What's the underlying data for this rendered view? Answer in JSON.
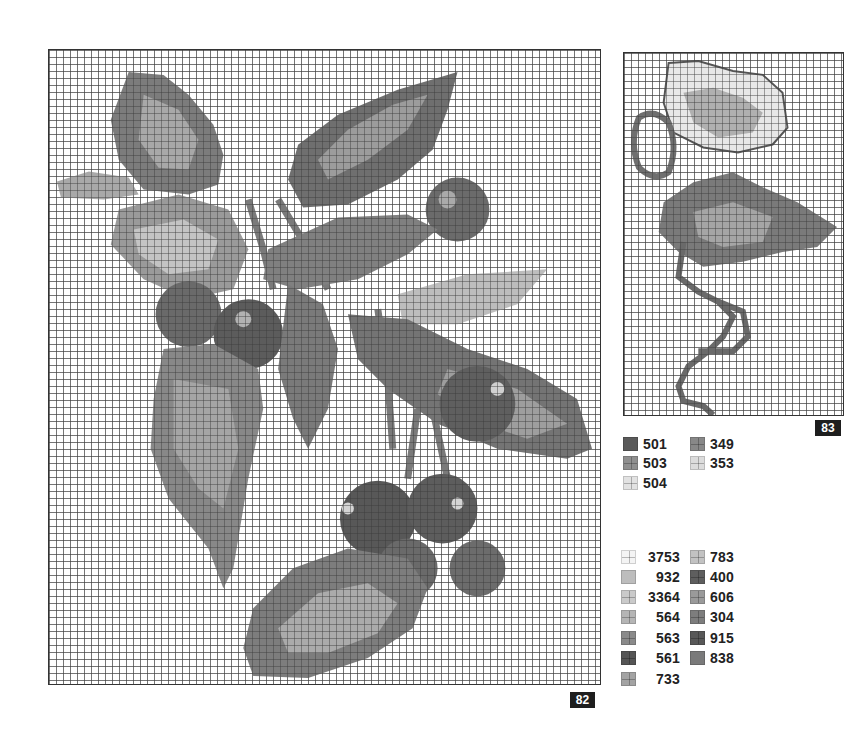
{
  "charts": [
    {
      "id": "main",
      "page_number": "82",
      "description": "Cross-stitch chart: cherry branch with leaves and clusters of cherries",
      "grid_cell_px": 7
    },
    {
      "id": "side",
      "page_number": "83",
      "description": "Cross-stitch chart: flower/leaf sprig with curling stem"
    }
  ],
  "key_top": {
    "items": [
      {
        "code": "501",
        "color": "#5a5a5a",
        "symbol": "solid"
      },
      {
        "code": "503",
        "color": "#8f8f8f",
        "symbol": "cross"
      },
      {
        "code": "504",
        "color": "#e2e2e2",
        "symbol": "cross"
      },
      {
        "code": "349",
        "color": "#888888",
        "symbol": "cross"
      },
      {
        "code": "353",
        "color": "#dcdcdc",
        "symbol": "cross"
      }
    ]
  },
  "key_bottom": {
    "items": [
      {
        "code": "3753",
        "color": "#f4f4f4",
        "symbol": "cross"
      },
      {
        "code": "932",
        "color": "#bdbdbd",
        "symbol": "solid"
      },
      {
        "code": "3364",
        "color": "#cacaca",
        "symbol": "cross"
      },
      {
        "code": "564",
        "color": "#b5b5b5",
        "symbol": "cross"
      },
      {
        "code": "563",
        "color": "#8a8a8a",
        "symbol": "cross"
      },
      {
        "code": "561",
        "color": "#555555",
        "symbol": "cross"
      },
      {
        "code": "733",
        "color": "#a3a3a3",
        "symbol": "cross"
      },
      {
        "code": "783",
        "color": "#c2c2c2",
        "symbol": "cross"
      },
      {
        "code": "400",
        "color": "#5e5e5e",
        "symbol": "cross"
      },
      {
        "code": "606",
        "color": "#9a9a9a",
        "symbol": "cross"
      },
      {
        "code": "304",
        "color": "#7d7d7d",
        "symbol": "cross"
      },
      {
        "code": "915",
        "color": "#585858",
        "symbol": "cross"
      },
      {
        "code": "838",
        "color": "#7a7a7a",
        "symbol": "solid"
      }
    ]
  }
}
